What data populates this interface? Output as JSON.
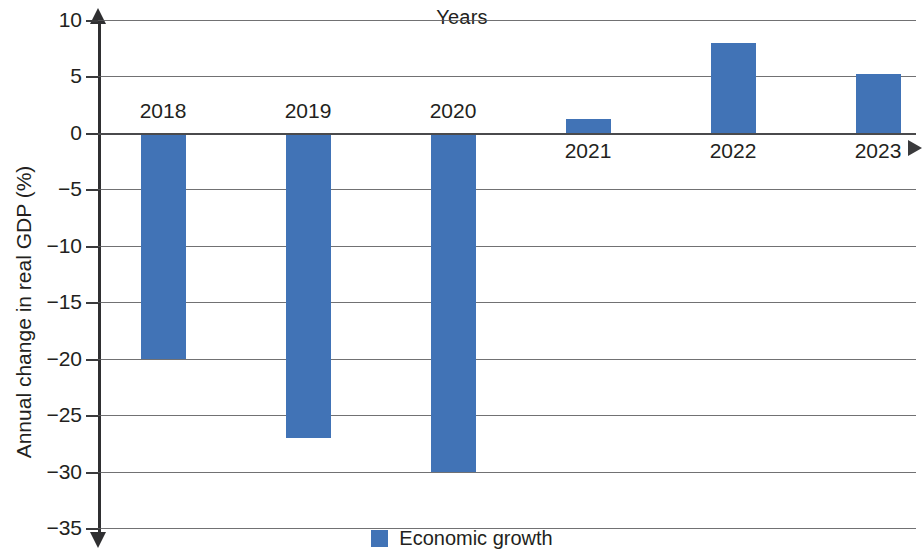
{
  "chart_data": {
    "type": "bar",
    "title": "",
    "xlabel": "Years",
    "ylabel": "Annual change in real GDP (%)",
    "categories": [
      "2018",
      "2019",
      "2020",
      "2021",
      "2022",
      "2023"
    ],
    "values": [
      -20,
      -27,
      -30,
      1.2,
      8,
      5.2
    ],
    "series": [
      {
        "name": "Economic growth",
        "values": [
          -20,
          -27,
          -30,
          1.2,
          8,
          5.2
        ],
        "color": "#4173b6"
      }
    ],
    "ylim": [
      -35,
      10
    ],
    "y_ticks": [
      10,
      5,
      0,
      -5,
      -10,
      -15,
      -20,
      -25,
      -30,
      -35
    ],
    "y_tick_labels": [
      "10",
      "5",
      "0",
      "−5",
      "−10",
      "−15",
      "−20",
      "−25",
      "−30",
      "−35"
    ],
    "grid": true,
    "legend_position": "bottom",
    "zero_line": 0
  },
  "axes": {
    "x_title": "Years",
    "y_title": "Annual change in real GDP (%)"
  },
  "legend": {
    "entries": [
      {
        "label": "Economic growth",
        "color": "#4173b6"
      }
    ]
  },
  "colors": {
    "bar": "#4173b6",
    "grid": "#58585a",
    "axis": "#2f2f31",
    "text": "#231f20"
  }
}
